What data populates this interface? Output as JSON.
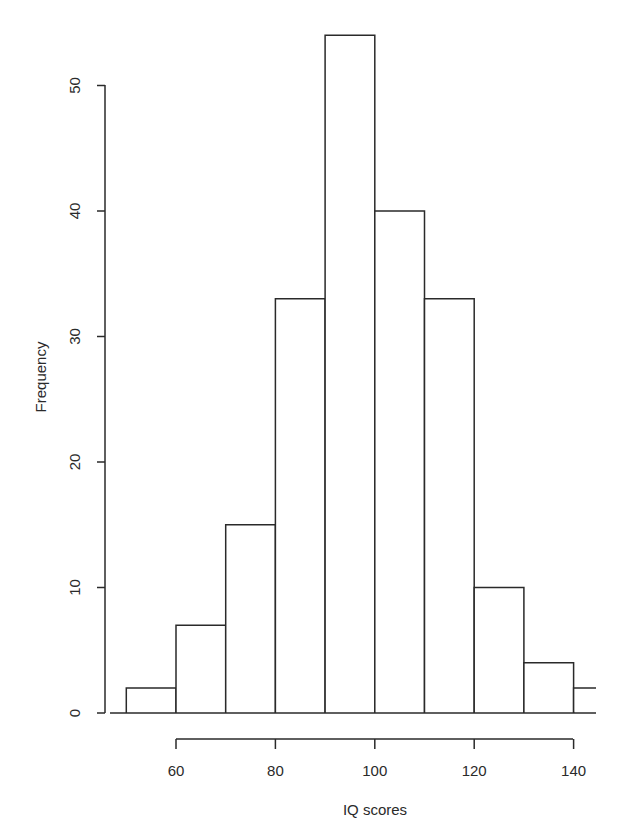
{
  "chart_data": {
    "type": "bar",
    "subtype": "histogram",
    "title": "",
    "xlabel": "IQ scores",
    "ylabel": "Frequency",
    "bins": [
      {
        "start": 50,
        "end": 60,
        "count": 2
      },
      {
        "start": 60,
        "end": 70,
        "count": 7
      },
      {
        "start": 70,
        "end": 80,
        "count": 15
      },
      {
        "start": 80,
        "end": 90,
        "count": 33
      },
      {
        "start": 90,
        "end": 100,
        "count": 54
      },
      {
        "start": 100,
        "end": 110,
        "count": 40
      },
      {
        "start": 110,
        "end": 120,
        "count": 33
      },
      {
        "start": 120,
        "end": 130,
        "count": 10
      },
      {
        "start": 130,
        "end": 140,
        "count": 4
      },
      {
        "start": 140,
        "end": 150,
        "count": 2
      }
    ],
    "categories": [
      "50-60",
      "60-70",
      "70-80",
      "80-90",
      "90-100",
      "100-110",
      "110-120",
      "120-130",
      "130-140",
      "140-150"
    ],
    "values": [
      2,
      7,
      15,
      33,
      54,
      40,
      33,
      10,
      4,
      2
    ],
    "x_ticks": [
      "60",
      "80",
      "100",
      "120",
      "140"
    ],
    "y_ticks": [
      "0",
      "10",
      "20",
      "30",
      "40",
      "50"
    ],
    "ylim": [
      0,
      50
    ],
    "xlim": [
      60,
      140
    ],
    "grid": false,
    "legend": null,
    "bar_fill": "#ffffff",
    "bar_stroke": "#2a2a2a"
  }
}
